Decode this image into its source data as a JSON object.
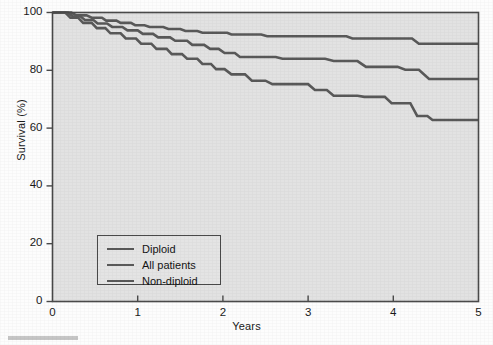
{
  "chart_data": {
    "type": "line",
    "title": "",
    "subtitle": "",
    "xlabel": "Years",
    "ylabel": "Survival (%)",
    "xlim": [
      0,
      5
    ],
    "ylim": [
      0,
      100
    ],
    "xticks": [
      "0",
      "1",
      "2",
      "3",
      "4",
      "5"
    ],
    "yticks": [
      "0",
      "20",
      "40",
      "60",
      "80",
      "100"
    ],
    "grid": false,
    "legend_position": "lower-left-inside",
    "line_color": "#595959",
    "plot_background": "#e2e2e2",
    "frame_color": "#4a4a4a",
    "series": [
      {
        "name": "Diploid",
        "color": "#595959",
        "points": [
          [
            0.0,
            100.0
          ],
          [
            0.22,
            100.0
          ],
          [
            0.28,
            99.0
          ],
          [
            0.4,
            99.0
          ],
          [
            0.46,
            98.2
          ],
          [
            0.58,
            98.2
          ],
          [
            0.63,
            97.2
          ],
          [
            0.75,
            97.2
          ],
          [
            0.8,
            96.4
          ],
          [
            0.92,
            96.4
          ],
          [
            0.97,
            95.6
          ],
          [
            1.08,
            95.6
          ],
          [
            1.14,
            95.0
          ],
          [
            1.3,
            95.0
          ],
          [
            1.36,
            94.3
          ],
          [
            1.5,
            94.3
          ],
          [
            1.56,
            93.6
          ],
          [
            1.7,
            93.6
          ],
          [
            1.76,
            93.0
          ],
          [
            2.05,
            93.0
          ],
          [
            2.1,
            92.4
          ],
          [
            2.45,
            92.4
          ],
          [
            2.52,
            91.8
          ],
          [
            3.45,
            91.8
          ],
          [
            3.52,
            91.0
          ],
          [
            4.22,
            91.0
          ],
          [
            4.3,
            89.2
          ],
          [
            5.0,
            89.2
          ]
        ]
      },
      {
        "name": "All patients",
        "color": "#595959",
        "points": [
          [
            0.0,
            100.0
          ],
          [
            0.18,
            100.0
          ],
          [
            0.24,
            98.6
          ],
          [
            0.33,
            98.6
          ],
          [
            0.38,
            97.4
          ],
          [
            0.48,
            97.4
          ],
          [
            0.53,
            96.2
          ],
          [
            0.64,
            96.2
          ],
          [
            0.7,
            95.0
          ],
          [
            0.82,
            95.0
          ],
          [
            0.88,
            93.8
          ],
          [
            1.0,
            93.8
          ],
          [
            1.06,
            92.6
          ],
          [
            1.18,
            92.6
          ],
          [
            1.24,
            91.4
          ],
          [
            1.38,
            91.4
          ],
          [
            1.44,
            90.2
          ],
          [
            1.58,
            90.2
          ],
          [
            1.64,
            88.8
          ],
          [
            1.78,
            88.8
          ],
          [
            1.85,
            87.4
          ],
          [
            1.95,
            87.4
          ],
          [
            2.02,
            86.0
          ],
          [
            2.14,
            86.0
          ],
          [
            2.2,
            84.6
          ],
          [
            2.62,
            84.6
          ],
          [
            2.7,
            84.0
          ],
          [
            3.2,
            84.0
          ],
          [
            3.3,
            83.2
          ],
          [
            3.58,
            83.2
          ],
          [
            3.68,
            81.2
          ],
          [
            4.05,
            81.2
          ],
          [
            4.14,
            80.2
          ],
          [
            4.3,
            80.2
          ],
          [
            4.42,
            77.0
          ],
          [
            5.0,
            77.0
          ]
        ]
      },
      {
        "name": "Non-diploid",
        "color": "#595959",
        "points": [
          [
            0.0,
            100.0
          ],
          [
            0.15,
            100.0
          ],
          [
            0.21,
            98.2
          ],
          [
            0.3,
            98.2
          ],
          [
            0.36,
            96.4
          ],
          [
            0.46,
            96.4
          ],
          [
            0.52,
            94.6
          ],
          [
            0.62,
            94.6
          ],
          [
            0.68,
            92.8
          ],
          [
            0.8,
            92.8
          ],
          [
            0.86,
            91.0
          ],
          [
            0.98,
            91.0
          ],
          [
            1.04,
            89.2
          ],
          [
            1.16,
            89.2
          ],
          [
            1.22,
            87.4
          ],
          [
            1.34,
            87.4
          ],
          [
            1.4,
            85.6
          ],
          [
            1.52,
            85.6
          ],
          [
            1.58,
            84.0
          ],
          [
            1.7,
            84.0
          ],
          [
            1.76,
            82.2
          ],
          [
            1.86,
            82.2
          ],
          [
            1.92,
            80.4
          ],
          [
            2.02,
            80.4
          ],
          [
            2.1,
            78.6
          ],
          [
            2.26,
            78.6
          ],
          [
            2.34,
            76.4
          ],
          [
            2.5,
            76.4
          ],
          [
            2.58,
            75.2
          ],
          [
            3.0,
            75.2
          ],
          [
            3.08,
            73.2
          ],
          [
            3.22,
            73.2
          ],
          [
            3.3,
            71.2
          ],
          [
            3.58,
            71.2
          ],
          [
            3.66,
            70.8
          ],
          [
            3.9,
            70.8
          ],
          [
            3.98,
            68.6
          ],
          [
            4.2,
            68.6
          ],
          [
            4.28,
            64.2
          ],
          [
            4.4,
            64.2
          ],
          [
            4.46,
            62.8
          ],
          [
            5.0,
            62.8
          ]
        ]
      }
    ]
  },
  "axes": {
    "ylabel": "Survival (%)",
    "xlabel": "Years"
  },
  "legend": {
    "items": [
      {
        "label": "Diploid"
      },
      {
        "label": "All patients"
      },
      {
        "label": "Non-diploid"
      }
    ]
  }
}
